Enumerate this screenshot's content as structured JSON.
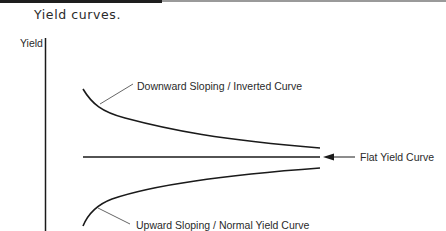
{
  "figure": {
    "caption": "Yield curves.",
    "y_axis_label": "Yield",
    "curves": [
      {
        "id": "inverted",
        "label": "Downward Sloping / Inverted Curve"
      },
      {
        "id": "flat",
        "label": "Flat Yield Curve"
      },
      {
        "id": "normal",
        "label": "Upward Sloping / Normal Yield Curve"
      }
    ],
    "colors": {
      "line": "#1a1a1a",
      "leader": "#555555",
      "text": "#2a2a2a"
    }
  }
}
